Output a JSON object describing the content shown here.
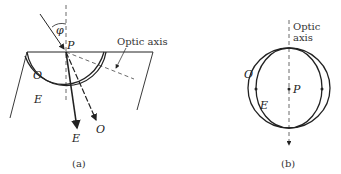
{
  "panel_a": {
    "caption": "(a)",
    "labels": {
      "angle": "φ",
      "point": "P",
      "optic_axis": "Optic axis",
      "o_wave": "O",
      "e_wave": "E",
      "o_ray": "O",
      "e_ray": "E"
    }
  },
  "panel_b": {
    "caption": "(b)",
    "labels": {
      "optic_axis_line1": "Optic",
      "optic_axis_line2": "axis",
      "point": "P",
      "o_wave": "O",
      "e_wave": "E"
    }
  },
  "colors": {
    "stroke": "#222222",
    "background": "#ffffff"
  }
}
